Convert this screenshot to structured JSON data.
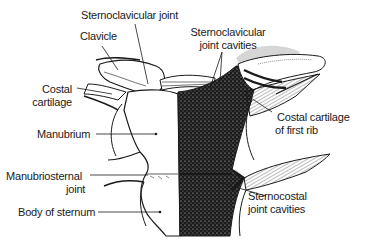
{
  "figure": {
    "labels": {
      "sternoclavicular_joint": "Sternoclavicular joint",
      "clavicle": "Clavicle",
      "costal_cartilage_1": "Costal",
      "costal_cartilage_2": "cartilage",
      "manubrium": "Manubrium",
      "manubriosternal_joint_1": "Manubriosternal",
      "manubriosternal_joint_2": "joint",
      "body_of_sternum": "Body of sternum",
      "sc_joint_cavities_1": "Sternoclavicular",
      "sc_joint_cavities_2": "joint cavities",
      "costal_first_rib_1": "Costal cartilage",
      "costal_first_rib_2": "of first rib",
      "sternocostal_cavities_1": "Sternocostal",
      "sternocostal_cavities_2": "joint cavities"
    },
    "signature": "HRS",
    "colors": {
      "ink": "#1a1a1a",
      "capsule_shade": "#d4d4d4",
      "background": "#ffffff"
    }
  }
}
